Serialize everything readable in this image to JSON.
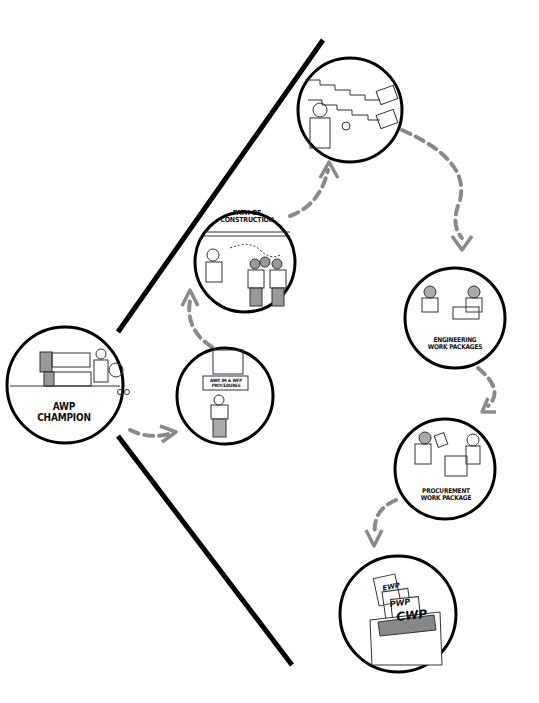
{
  "diagram": {
    "type": "process-flow",
    "colors": {
      "background": "#ffffff",
      "line": "#000000",
      "arrow": "#8a8a8a",
      "figure_fill": "#9a9a9a"
    },
    "nodes": [
      {
        "id": "awp-champion",
        "lines": [
          "AWP",
          "CHAMPION"
        ]
      },
      {
        "id": "procedures",
        "lines": [
          "AWP, IM & WFP",
          "PROCEDURES"
        ]
      },
      {
        "id": "path-of-construction",
        "lines": [
          "PATH OF",
          "CONSTRUCTION"
        ]
      },
      {
        "id": "schedule",
        "lines": []
      },
      {
        "id": "engineering",
        "lines": [
          "ENGINEERING",
          "WORK PACKAGES"
        ]
      },
      {
        "id": "procurement",
        "lines": [
          "PROCUREMENT",
          "WORK PACKAGE"
        ]
      },
      {
        "id": "cwp",
        "lines": [],
        "folder_labels": [
          "IWP",
          "EWP",
          "PWP",
          "CWP"
        ]
      }
    ],
    "edges": [
      {
        "from": "awp-champion",
        "to": "procedures"
      },
      {
        "from": "procedures",
        "to": "path-of-construction"
      },
      {
        "from": "path-of-construction",
        "to": "schedule"
      },
      {
        "from": "schedule",
        "to": "engineering"
      },
      {
        "from": "engineering",
        "to": "procurement"
      },
      {
        "from": "procurement",
        "to": "cwp"
      }
    ]
  }
}
